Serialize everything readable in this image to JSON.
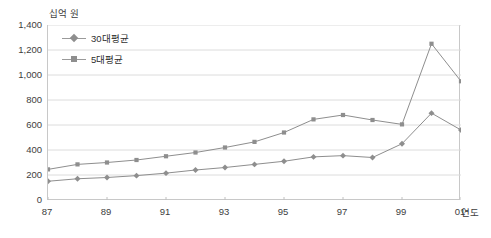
{
  "chart_data": {
    "type": "line",
    "title": "",
    "xlabel": "연도",
    "ylabel": "십억 원",
    "ylim": [
      0,
      1400
    ],
    "ystep": 200,
    "grid": true,
    "legend_position": "top-left",
    "x": [
      1987,
      1988,
      1989,
      1990,
      1991,
      1992,
      1993,
      1994,
      1995,
      1996,
      1997,
      1998,
      1999,
      2000,
      2001
    ],
    "x_tick_labels": [
      "87",
      "89",
      "91",
      "93",
      "95",
      "97",
      "99",
      "01"
    ],
    "x_tick_values": [
      1987,
      1989,
      1991,
      1993,
      1995,
      1997,
      1999,
      2001
    ],
    "y_tick_labels": [
      "0",
      "200",
      "400",
      "600",
      "800",
      "1,000",
      "1,200",
      "1,400"
    ],
    "y_tick_values": [
      0,
      200,
      400,
      600,
      800,
      1000,
      1200,
      1400
    ],
    "series": [
      {
        "name": "30대평균",
        "marker": "diamond",
        "color": "#8e8e8e",
        "values": [
          150,
          170,
          180,
          195,
          215,
          240,
          260,
          285,
          310,
          345,
          355,
          340,
          450,
          695,
          560
        ]
      },
      {
        "name": "5대평균",
        "marker": "square",
        "color": "#8e8e8e",
        "values": [
          245,
          285,
          300,
          320,
          350,
          380,
          420,
          465,
          540,
          645,
          680,
          640,
          605,
          1250,
          950
        ]
      }
    ]
  },
  "axes": {
    "unit_label": "십억 원",
    "x_axis_label": "연도"
  },
  "title_sliver": "",
  "legend": {
    "items": [
      {
        "label": "30대평균",
        "marker": "diamond"
      },
      {
        "label": "5대평균",
        "marker": "square"
      }
    ]
  }
}
